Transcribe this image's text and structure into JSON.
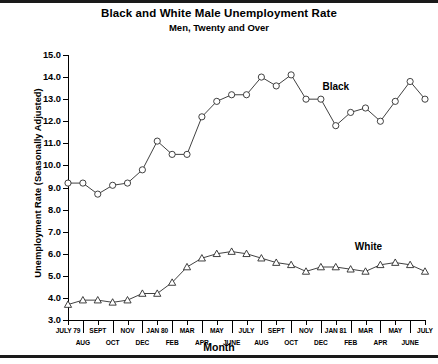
{
  "chart_data": {
    "type": "line",
    "title": "Black and White Male Unemployment Rate",
    "subtitle": "Men, Twenty and Over",
    "xlabel": "Month",
    "ylabel": "Unemployment Rate (Seasonally Adjusted)",
    "ylim": [
      3.0,
      15.0
    ],
    "ytick_labels": [
      "15.0",
      "14.0",
      "13.0",
      "12.0",
      "11.0",
      "10.0",
      "9.0",
      "8.0",
      "7.0",
      "6.0",
      "5.0",
      "4.0",
      "3.0"
    ],
    "yticks": [
      15.0,
      14.0,
      13.0,
      12.0,
      11.0,
      10.0,
      9.0,
      8.0,
      7.0,
      6.0,
      5.0,
      4.0,
      3.0
    ],
    "grid": false,
    "legend_position": "inline-annotation",
    "x_top_labels": [
      "JULY 79",
      "SEPT",
      "NOV",
      "JAN 80",
      "MAR",
      "MAY",
      "JULY",
      "SEPT",
      "NOV",
      "JAN 81",
      "MAR",
      "MAY",
      "JULY"
    ],
    "x_bottom_labels": [
      "AUG",
      "OCT",
      "DEC",
      "FEB",
      "APR",
      "JUNE",
      "AUG",
      "OCT",
      "DEC",
      "FEB",
      "APR",
      "JUNE"
    ],
    "x": [
      "JULY 79",
      "AUG",
      "SEPT",
      "OCT",
      "NOV",
      "DEC",
      "JAN 80",
      "FEB",
      "MAR",
      "APR",
      "MAY",
      "JUNE",
      "JULY",
      "AUG",
      "SEPT",
      "OCT",
      "NOV",
      "DEC",
      "JAN 81",
      "FEB",
      "MAR",
      "APR",
      "MAY",
      "JUNE",
      "JULY"
    ],
    "series": [
      {
        "name": "Black",
        "marker": "circle",
        "values": [
          9.2,
          9.2,
          8.7,
          9.1,
          9.2,
          9.8,
          11.1,
          10.5,
          10.5,
          12.2,
          12.9,
          13.2,
          13.2,
          14.0,
          13.6,
          14.1,
          13.0,
          13.0,
          11.8,
          12.4,
          12.6,
          12.0,
          12.9,
          13.8,
          13.0
        ]
      },
      {
        "name": "White",
        "marker": "triangle",
        "values": [
          3.7,
          3.9,
          3.9,
          3.8,
          3.9,
          4.2,
          4.2,
          4.7,
          5.4,
          5.8,
          6.0,
          6.1,
          6.0,
          5.8,
          5.6,
          5.5,
          5.2,
          5.4,
          5.4,
          5.3,
          5.2,
          5.5,
          5.6,
          5.5,
          5.2
        ]
      }
    ]
  },
  "annotations": {
    "black_label": "Black",
    "white_label": "White"
  }
}
